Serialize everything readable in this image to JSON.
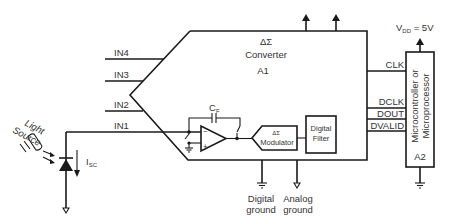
{
  "diagram": {
    "converter": {
      "symbol": "ΔΣ",
      "name": "Converter",
      "ref": "A1",
      "inputs": [
        "IN4",
        "IN3",
        "IN2",
        "IN1"
      ]
    },
    "feedback_capacitor": {
      "label": "C",
      "subscript": "F"
    },
    "modulator": {
      "symbol": "ΔΣ",
      "label": "Modulator"
    },
    "digital_filter": {
      "line1": "Digital",
      "line2": "Filter"
    },
    "grounds": {
      "digital": {
        "line1": "Digital",
        "line2": "ground"
      },
      "analog": {
        "line1": "Analog",
        "line2": "ground"
      }
    },
    "signals": [
      "CLK",
      "DCLK",
      "DOUT",
      "DVALID"
    ],
    "microcontroller": {
      "line1": "Microcontroller or",
      "line2": "Microprocessor",
      "ref": "A2"
    },
    "supply": {
      "prefix": "V",
      "subscript": "DD",
      "value": " = 5V"
    },
    "light_source": {
      "line1": "Light",
      "line2": "Source"
    },
    "photocurrent": {
      "label": "I",
      "subscript": "SC"
    },
    "colors": {
      "line": "#1a1a1a",
      "text": "#333333",
      "background": "#ffffff"
    }
  }
}
